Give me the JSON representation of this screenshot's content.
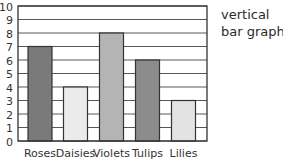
{
  "caption": {
    "line1": "vertical",
    "line2": "bar graph"
  },
  "colors": {
    "axis": "#333333",
    "grid": "#444444",
    "bar_outline": "#333333"
  },
  "chart_data": {
    "type": "bar",
    "title": "",
    "xlabel": "",
    "ylabel": "",
    "categories": [
      "Roses",
      "Daisies",
      "Violets",
      "Tulips",
      "Lilies"
    ],
    "values": [
      7,
      4,
      8,
      6,
      3
    ],
    "bar_colors": [
      "#7a7a7a",
      "#ebebeb",
      "#b4b4b4",
      "#8c8c8c",
      "#e3e3e3"
    ],
    "ylim": [
      0,
      10
    ],
    "yticks": [
      0,
      1,
      2,
      3,
      4,
      5,
      6,
      7,
      8,
      9,
      10
    ],
    "grid": true,
    "legend": null
  }
}
